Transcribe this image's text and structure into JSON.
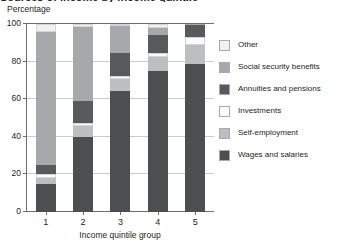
{
  "clipped_title": "Sources of income by income quintile group",
  "axis": {
    "ylabel": "Percentage",
    "xlabel": "Income quintile group",
    "yticks": [
      "0",
      "20",
      "40",
      "60",
      "80",
      "100"
    ],
    "xticks": [
      "1",
      "2",
      "3",
      "4",
      "5"
    ]
  },
  "colors": {
    "other": "#f1f1f1",
    "social_security_benefits": "#a6a8ab",
    "annuities_and_pensions": "#58595b",
    "investments": "#fbfbfb",
    "self_employment": "#bcbec0",
    "wages_and_salaries": "#4d4e50",
    "gridline": "#c9cacb",
    "axis": "#6d6e71",
    "text": "#231f20"
  },
  "legend": {
    "items": [
      {
        "label": "Other",
        "key": "other"
      },
      {
        "label": "Social security benefits",
        "key": "social_security_benefits"
      },
      {
        "label": "Annuities and pensions",
        "key": "annuities_and_pensions"
      },
      {
        "label": "Investments",
        "key": "investments"
      },
      {
        "label": "Self-employment",
        "key": "self_employment"
      },
      {
        "label": "Wages and salaries",
        "key": "wages_and_salaries"
      }
    ]
  },
  "chart_data": {
    "type": "bar",
    "stacked": true,
    "title": "Sources of income by income quintile group",
    "xlabel": "Income quintile group",
    "ylabel": "Percentage",
    "ylim": [
      0,
      100
    ],
    "yticks": [
      0,
      20,
      40,
      60,
      80,
      100
    ],
    "grid": true,
    "legend_position": "right",
    "categories": [
      "1",
      "2",
      "3",
      "4",
      "5"
    ],
    "series": [
      {
        "name": "Wages and salaries",
        "key": "wages_and_salaries",
        "values": [
          15.0,
          40.0,
          64.5,
          75.0,
          78.5
        ]
      },
      {
        "name": "Self-employment",
        "key": "self_employment",
        "values": [
          3.0,
          6.0,
          6.5,
          7.5,
          10.5
        ]
      },
      {
        "name": "Investments",
        "key": "investments",
        "values": [
          2.0,
          1.5,
          1.5,
          2.0,
          4.0
        ]
      },
      {
        "name": "Annuities and pensions",
        "key": "annuities_and_pensions",
        "values": [
          5.0,
          11.5,
          12.0,
          9.5,
          6.5
        ]
      },
      {
        "name": "Social security benefits",
        "key": "social_security_benefits",
        "values": [
          71.0,
          39.5,
          14.5,
          4.0,
          0.5
        ]
      },
      {
        "name": "Other",
        "key": "other",
        "values": [
          4.0,
          1.5,
          1.0,
          2.0,
          0.0
        ]
      }
    ]
  }
}
